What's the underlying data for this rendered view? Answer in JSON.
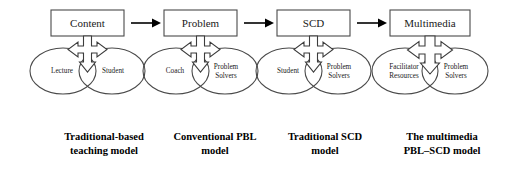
{
  "figure": {
    "background_color": "#ffffff",
    "stroke_color": "#4a4a4a",
    "arrow_color": "#000000"
  },
  "groups": [
    {
      "id": "traditional-based-teaching",
      "box_label": "Content",
      "ovals": [
        {
          "label_line1": "Lecture",
          "label_line2": ""
        },
        {
          "label_line1": "Student",
          "label_line2": ""
        }
      ],
      "caption_line1": "Traditional-based",
      "caption_line2": "teaching model"
    },
    {
      "id": "conventional-pbl",
      "box_label": "Problem",
      "ovals": [
        {
          "label_line1": "Coach",
          "label_line2": ""
        },
        {
          "label_line1": "Problem",
          "label_line2": "Solvers"
        }
      ],
      "caption_line1": "Conventional PBL",
      "caption_line2": "model"
    },
    {
      "id": "traditional-scd",
      "box_label": "SCD",
      "ovals": [
        {
          "label_line1": "Student",
          "label_line2": ""
        },
        {
          "label_line1": "Problem",
          "label_line2": "Solvers"
        }
      ],
      "caption_line1": "Traditional SCD",
      "caption_line2": "model"
    },
    {
      "id": "multimedia-pbl-scd",
      "box_label": "Multimedia",
      "ovals": [
        {
          "label_line1": "Facilitator",
          "label_line2": "Resources"
        },
        {
          "label_line1": "Problem",
          "label_line2": "Solvers"
        }
      ],
      "caption_line1": "The multimedia",
      "caption_line2": "PBL–SCD model"
    }
  ],
  "connectors": [
    {
      "id": "connector-1",
      "from": "Content",
      "to": "Problem",
      "glyph": "right-arrow"
    },
    {
      "id": "connector-2",
      "from": "Problem",
      "to": "SCD",
      "glyph": "right-arrow"
    },
    {
      "id": "connector-3",
      "from": "SCD",
      "to": "Multimedia",
      "glyph": "right-arrow"
    }
  ],
  "multi_arrows": [
    {
      "id": "multi-arrow-1",
      "directions": "up-left-right-down"
    },
    {
      "id": "multi-arrow-2",
      "directions": "up-left-right-down"
    },
    {
      "id": "multi-arrow-3",
      "directions": "up-left-right-down"
    },
    {
      "id": "multi-arrow-4",
      "directions": "up-left-right-down"
    }
  ]
}
